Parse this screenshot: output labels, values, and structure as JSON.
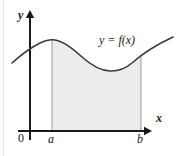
{
  "figure": {
    "background_color": "#ffffff",
    "ink_color": "#1a1a1a",
    "shade_color": "#ececec",
    "shade_border_color": "#9a9a9a",
    "edge_rule_color": "#e3e3e3"
  },
  "axes": {
    "y_axis_label": "y",
    "x_axis_label": "x",
    "origin_label": "0",
    "x_axis_y_px": 131,
    "y_axis_x_px": 30,
    "x_axis_arrow_tip_px": 152,
    "y_axis_arrow_tip_px": 10
  },
  "ticks": [
    {
      "name": "a",
      "label": "a",
      "x_px": 52
    },
    {
      "name": "b",
      "label": "b",
      "x_px": 141
    }
  ],
  "curve": {
    "label": "y = f(x)",
    "stroke_width": 1.6,
    "path": "M 12,63 C 22,54 30,48 40,43 C 47,40 50,39.5 53,39.8 C 63,40.8 72,48 82,57 C 92,66 100,70.5 110,71 C 118,71.3 125,69 132,63 C 142,54 158,44 173,37"
  },
  "shaded_region": {
    "name": "area-under-curve",
    "from_label": "a",
    "to_label": "b",
    "path": "M 52,39.8 C 63,40.8 72,48 82,57 C 92,66 100,70.5 110,71 C 118,71.3 125,69 132,63 C 135,60.5 138,58.5 141,56.6 L 141,131 L 52,131 Z"
  },
  "boundary_lines": [
    {
      "name": "ordinate-at-a",
      "x_px": 52,
      "y_top_px": 39.8,
      "y_bottom_px": 131
    },
    {
      "name": "ordinate-at-b",
      "x_px": 141,
      "y_top_px": 56.6,
      "y_bottom_px": 131
    }
  ],
  "chart_data": {
    "type": "line",
    "title": "y = f(x)",
    "xlabel": "x",
    "ylabel": "y",
    "legend": [
      "y = f(x)"
    ],
    "grid": false,
    "annotations": [
      "0",
      "a",
      "b",
      "y = f(x)"
    ],
    "xlim": [
      0,
      180
    ],
    "ylim": [
      0,
      156
    ],
    "tick_labels_x": [
      "0",
      "a",
      "b"
    ],
    "tick_labels_y": [],
    "shaded_interval": [
      "a",
      "b"
    ],
    "x": [
      12,
      22,
      30,
      40,
      52,
      62,
      72,
      82,
      92,
      102,
      112,
      122,
      132,
      142,
      152,
      162,
      173
    ],
    "y": [
      63,
      54,
      48,
      43,
      39.8,
      40.8,
      48,
      57,
      66,
      70,
      71,
      70,
      63,
      56,
      49,
      43,
      37
    ]
  }
}
